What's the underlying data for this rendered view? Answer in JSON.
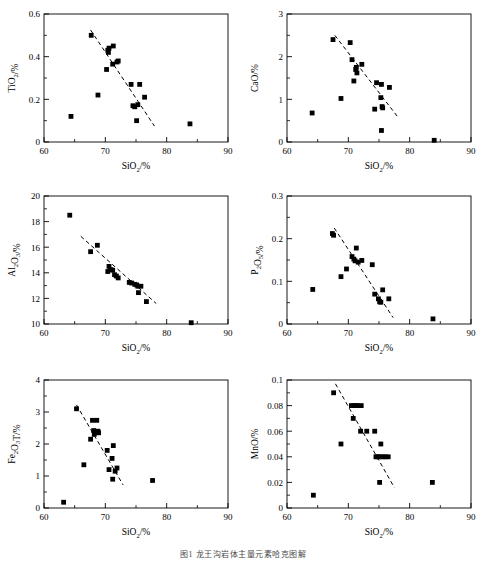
{
  "figure": {
    "caption": "图1  龙王沟岩体主量元素哈克图解",
    "panel_count": 6
  },
  "axis_common": {
    "xlabel_main": "SiO",
    "xlabel_sub": "2",
    "xlabel_unit": "/%",
    "xticks": [
      60,
      70,
      80,
      90
    ],
    "xlim": [
      60,
      90
    ]
  },
  "chart_data": [
    {
      "id": "tio2",
      "type": "scatter",
      "title": "",
      "xlabel": "SiO2/%",
      "ylabel": "TiO2/%",
      "ylabel_main": "TiO",
      "ylabel_sub": "2",
      "ylabel_unit": "/%",
      "xlim": [
        60,
        90
      ],
      "ylim": [
        0,
        0.6
      ],
      "xticks": [
        60,
        70,
        80,
        90
      ],
      "yticks": [
        0,
        0.2,
        0.4,
        0.6
      ],
      "ytick_labels": [
        "0",
        "0.2",
        "0.4",
        "0.6"
      ],
      "minor_ticks": true,
      "grid": false,
      "marker": "filled-square",
      "points": [
        [
          64.4,
          0.12
        ],
        [
          67.7,
          0.5
        ],
        [
          68.8,
          0.22
        ],
        [
          70.2,
          0.34
        ],
        [
          70.4,
          0.43
        ],
        [
          70.5,
          0.42
        ],
        [
          70.6,
          0.44
        ],
        [
          71.3,
          0.45
        ],
        [
          71.2,
          0.365
        ],
        [
          71.9,
          0.375
        ],
        [
          72.1,
          0.38
        ],
        [
          74.2,
          0.27
        ],
        [
          74.5,
          0.17
        ],
        [
          74.8,
          0.165
        ],
        [
          75.1,
          0.1
        ],
        [
          75.3,
          0.175
        ],
        [
          75.6,
          0.27
        ],
        [
          76.4,
          0.21
        ],
        [
          83.8,
          0.085
        ]
      ],
      "trendline": {
        "x": [
          67.6,
          78.0
        ],
        "y": [
          0.525,
          0.075
        ],
        "style": "dashed"
      }
    },
    {
      "id": "cao",
      "type": "scatter",
      "title": "",
      "xlabel": "SiO2/%",
      "ylabel": "CaO/%",
      "ylabel_main": "CaO",
      "ylabel_sub": "",
      "ylabel_unit": "/%",
      "xlim": [
        60,
        90
      ],
      "ylim": [
        0,
        3
      ],
      "xticks": [
        60,
        70,
        80,
        90
      ],
      "yticks": [
        0,
        1,
        2,
        3
      ],
      "ytick_labels": [
        "0",
        "1",
        "2",
        "3"
      ],
      "minor_ticks": true,
      "grid": false,
      "marker": "filled-square",
      "points": [
        [
          64.1,
          0.68
        ],
        [
          67.5,
          2.4
        ],
        [
          68.8,
          1.02
        ],
        [
          70.3,
          2.33
        ],
        [
          70.6,
          1.93
        ],
        [
          70.9,
          1.43
        ],
        [
          71.2,
          1.7
        ],
        [
          71.3,
          1.75
        ],
        [
          71.4,
          1.62
        ],
        [
          72.2,
          1.82
        ],
        [
          74.3,
          0.77
        ],
        [
          74.6,
          1.39
        ],
        [
          75.3,
          1.04
        ],
        [
          75.4,
          1.35
        ],
        [
          75.5,
          0.83
        ],
        [
          75.6,
          0.8
        ],
        [
          75.4,
          0.27
        ],
        [
          76.7,
          1.28
        ],
        [
          84.0,
          0.04
        ]
      ],
      "trendline": {
        "x": [
          67.8,
          78.1
        ],
        "y": [
          2.5,
          0.58
        ],
        "style": "dashed"
      }
    },
    {
      "id": "al2o3",
      "type": "scatter",
      "title": "",
      "xlabel": "SiO2/%",
      "ylabel": "Al2O3/%",
      "ylabel_main": "Al",
      "ylabel_sub": "2",
      "ylabel_main2": "O",
      "ylabel_sub2": "3",
      "ylabel_unit": "/%",
      "xlim": [
        60,
        90
      ],
      "ylim": [
        10,
        20
      ],
      "xticks": [
        60,
        70,
        80,
        90
      ],
      "yticks": [
        10,
        12,
        14,
        16,
        18,
        20
      ],
      "ytick_labels": [
        "10",
        "12",
        "14",
        "16",
        "18",
        "20"
      ],
      "minor_ticks": true,
      "grid": false,
      "marker": "filled-square",
      "points": [
        [
          64.2,
          18.5
        ],
        [
          67.6,
          15.65
        ],
        [
          68.7,
          16.15
        ],
        [
          70.4,
          14.1
        ],
        [
          70.6,
          14.5
        ],
        [
          70.9,
          14.25
        ],
        [
          71.2,
          14.2
        ],
        [
          71.5,
          13.85
        ],
        [
          71.8,
          13.75
        ],
        [
          72.1,
          13.6
        ],
        [
          73.9,
          13.25
        ],
        [
          74.3,
          13.2
        ],
        [
          74.8,
          13.1
        ],
        [
          75.1,
          13.05
        ],
        [
          75.3,
          12.95
        ],
        [
          75.4,
          12.45
        ],
        [
          75.8,
          12.95
        ],
        [
          76.7,
          11.75
        ],
        [
          84.0,
          10.1
        ]
      ],
      "trendline": {
        "x": [
          66.0,
          78.3
        ],
        "y": [
          16.85,
          11.6
        ],
        "style": "dashed"
      }
    },
    {
      "id": "p2o5",
      "type": "scatter",
      "title": "",
      "xlabel": "SiO2/%",
      "ylabel": "P2O5/%",
      "ylabel_main": "P",
      "ylabel_sub": "2",
      "ylabel_main2": "O",
      "ylabel_sub2": "5",
      "ylabel_unit": "/%",
      "xlim": [
        60,
        90
      ],
      "ylim": [
        0,
        0.3
      ],
      "xticks": [
        60,
        70,
        80,
        90
      ],
      "yticks": [
        0,
        0.1,
        0.2,
        0.3
      ],
      "ytick_labels": [
        "0",
        "0.1",
        "0.2",
        "0.3"
      ],
      "minor_ticks": true,
      "grid": false,
      "marker": "filled-square",
      "points": [
        [
          64.2,
          0.081
        ],
        [
          67.4,
          0.212
        ],
        [
          67.6,
          0.208
        ],
        [
          68.8,
          0.111
        ],
        [
          69.7,
          0.129
        ],
        [
          70.6,
          0.158
        ],
        [
          70.9,
          0.152
        ],
        [
          71.1,
          0.148
        ],
        [
          71.3,
          0.178
        ],
        [
          71.6,
          0.145
        ],
        [
          72.2,
          0.149
        ],
        [
          73.9,
          0.139
        ],
        [
          74.3,
          0.07
        ],
        [
          74.9,
          0.059
        ],
        [
          75.1,
          0.052
        ],
        [
          75.3,
          0.051
        ],
        [
          75.6,
          0.08
        ],
        [
          76.6,
          0.059
        ],
        [
          83.8,
          0.012
        ]
      ],
      "trendline": {
        "x": [
          67.7,
          77.3
        ],
        "y": [
          0.225,
          0.015
        ],
        "style": "dashed"
      }
    },
    {
      "id": "fe2o3t",
      "type": "scatter",
      "title": "",
      "xlabel": "SiO2/%",
      "ylabel": "Fe2O3T/%",
      "ylabel_main": "Fe",
      "ylabel_sub": "2",
      "ylabel_main2": "O",
      "ylabel_sub2": "3",
      "ylabel_main3": "T",
      "ylabel_unit": "/%",
      "xlim": [
        60,
        90
      ],
      "ylim": [
        0,
        4
      ],
      "xticks": [
        60,
        70,
        80,
        90
      ],
      "yticks": [
        0,
        1,
        2,
        3,
        4
      ],
      "ytick_labels": [
        "0",
        "1",
        "2",
        "3",
        "4"
      ],
      "minor_ticks": true,
      "grid": false,
      "marker": "filled-square",
      "points": [
        [
          63.2,
          0.18
        ],
        [
          65.3,
          3.1
        ],
        [
          66.5,
          1.35
        ],
        [
          67.6,
          2.15
        ],
        [
          67.9,
          2.74
        ],
        [
          68.1,
          2.42
        ],
        [
          68.2,
          2.3
        ],
        [
          68.3,
          2.37
        ],
        [
          68.6,
          2.74
        ],
        [
          68.8,
          2.4
        ],
        [
          68.9,
          2.35
        ],
        [
          70.3,
          1.8
        ],
        [
          70.6,
          1.2
        ],
        [
          71.1,
          1.55
        ],
        [
          71.3,
          1.95
        ],
        [
          71.2,
          0.9
        ],
        [
          71.6,
          1.15
        ],
        [
          71.9,
          1.25
        ],
        [
          77.7,
          0.86
        ]
      ],
      "trendline": {
        "x": [
          65.3,
          72.9
        ],
        "y": [
          3.22,
          0.72
        ],
        "style": "dashed"
      }
    },
    {
      "id": "mno",
      "type": "scatter",
      "title": "",
      "xlabel": "SiO2/%",
      "ylabel": "MnO/%",
      "ylabel_main": "MnO",
      "ylabel_sub": "",
      "ylabel_unit": "/%",
      "xlim": [
        60,
        90
      ],
      "ylim": [
        0,
        0.1
      ],
      "xticks": [
        60,
        70,
        80,
        90
      ],
      "yticks": [
        0,
        0.02,
        0.04,
        0.06,
        0.08,
        0.1
      ],
      "ytick_labels": [
        "0",
        "0.02",
        "0.04",
        "0.06",
        "0.08",
        "0.1"
      ],
      "minor_ticks": true,
      "grid": false,
      "marker": "filled-square",
      "points": [
        [
          64.3,
          0.01
        ],
        [
          67.6,
          0.09
        ],
        [
          68.8,
          0.05
        ],
        [
          70.5,
          0.08
        ],
        [
          70.9,
          0.08
        ],
        [
          71.2,
          0.08
        ],
        [
          71.5,
          0.08
        ],
        [
          72.1,
          0.08
        ],
        [
          70.8,
          0.07
        ],
        [
          72.0,
          0.06
        ],
        [
          73.0,
          0.06
        ],
        [
          74.3,
          0.06
        ],
        [
          74.5,
          0.04
        ],
        [
          74.8,
          0.04
        ],
        [
          75.1,
          0.04
        ],
        [
          75.3,
          0.05
        ],
        [
          75.6,
          0.04
        ],
        [
          76.0,
          0.04
        ],
        [
          76.5,
          0.04
        ],
        [
          75.1,
          0.02
        ],
        [
          83.7,
          0.02
        ]
      ],
      "trendline": {
        "x": [
          67.9,
          77.5
        ],
        "y": [
          0.097,
          0.016
        ],
        "style": "dashed"
      }
    }
  ]
}
